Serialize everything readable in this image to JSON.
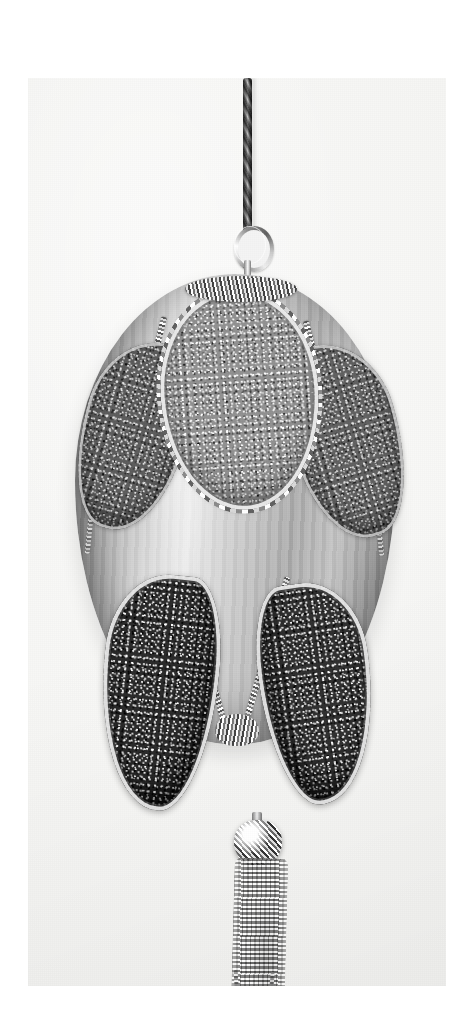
{
  "image": {
    "kind": "photograph",
    "color_mode": "black-and-white",
    "subject": "hanging egg-shaped Christmas ornament",
    "caption": "",
    "print": {
      "background_color": "#f6f6f4",
      "paper_margin_color": "#ffffff"
    }
  },
  "parts": {
    "cord": {
      "name": "braided hanging cord",
      "color": "#8e8e8e"
    },
    "ring": {
      "name": "metal hanging ring",
      "color": "#c9c9c9"
    },
    "body": {
      "name": "satin egg body",
      "color": "#c2c2c0",
      "finish": "vertically striated satin"
    },
    "panels": [
      {
        "id": "top-center",
        "name": "top center glitter teardrop panel",
        "tone": "light",
        "color": "#8e8e8e",
        "trim": "beaded silver trim"
      },
      {
        "id": "upper-left",
        "name": "upper left glitter wedge panel",
        "tone": "medium-dark",
        "color": "#6a6a6a",
        "trim": "beaded silver trim"
      },
      {
        "id": "upper-right",
        "name": "upper right glitter wedge panel",
        "tone": "medium-dark",
        "color": "#6e6e6e",
        "trim": "beaded silver trim"
      },
      {
        "id": "lower-left",
        "name": "lower left glitter teardrop panel",
        "tone": "dark",
        "color": "#3b3b3b",
        "trim": "beaded silver trim"
      },
      {
        "id": "lower-right",
        "name": "lower right glitter teardrop panel",
        "tone": "dark",
        "color": "#3f3f3f",
        "trim": "beaded silver trim"
      }
    ],
    "tassel": {
      "name": "metal chain tassel",
      "color": "#b4b4b4",
      "cap": "beaded ball cap"
    }
  }
}
